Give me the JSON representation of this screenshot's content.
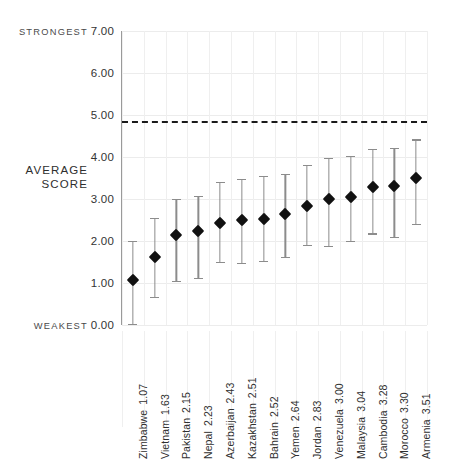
{
  "chart_data": {
    "type": "scatter",
    "title": "",
    "subtitle": "",
    "xlabel": "",
    "ylabel": "AVERAGE SCORE",
    "ylim": [
      0.0,
      7.0
    ],
    "yticks": [
      "0.00",
      "1.00",
      "2.00",
      "3.00",
      "4.00",
      "5.00",
      "6.00",
      "7.00"
    ],
    "ytick_values": [
      0,
      1,
      2,
      3,
      4,
      5,
      6,
      7
    ],
    "grid": true,
    "legend": null,
    "axis_annotations": {
      "top": "STRONGEST",
      "middle": "AVERAGE SCORE",
      "bottom": "WEAKEST"
    },
    "threshold_line": {
      "value": 4.86,
      "style": "dashed",
      "color": "#1a1a1a",
      "label": ""
    },
    "categories": [
      "Zimbabwe",
      "Vietnam",
      "Pakistan",
      "Nepal",
      "Azerbaijan",
      "Kazakhstan",
      "Bahrain",
      "Yemen",
      "Jordan",
      "Venezuela",
      "Malaysia",
      "Cambodia",
      "Morocco",
      "Armenia"
    ],
    "values": [
      1.07,
      1.63,
      2.15,
      2.23,
      2.43,
      2.51,
      2.52,
      2.64,
      2.83,
      3.0,
      3.04,
      3.28,
      3.3,
      3.51
    ],
    "error_low": [
      0.03,
      0.67,
      1.05,
      1.13,
      1.5,
      1.48,
      1.52,
      1.62,
      1.9,
      1.88,
      2.0,
      2.18,
      2.1,
      2.4
    ],
    "error_high": [
      2.0,
      2.55,
      3.0,
      3.07,
      3.4,
      3.48,
      3.55,
      3.6,
      3.82,
      3.98,
      4.02,
      4.2,
      4.22,
      4.42
    ],
    "points": [
      {
        "label": "Zimbabwe",
        "value": 1.07,
        "low": 0.03,
        "high": 2.0
      },
      {
        "label": "Vietnam",
        "value": 1.63,
        "low": 0.67,
        "high": 2.55
      },
      {
        "label": "Pakistan",
        "value": 2.15,
        "low": 1.05,
        "high": 3.0
      },
      {
        "label": "Nepal",
        "value": 2.23,
        "low": 1.13,
        "high": 3.07
      },
      {
        "label": "Azerbaijan",
        "value": 2.43,
        "low": 1.5,
        "high": 3.4
      },
      {
        "label": "Kazakhstan",
        "value": 2.51,
        "low": 1.48,
        "high": 3.48
      },
      {
        "label": "Bahrain",
        "value": 2.52,
        "low": 1.52,
        "high": 3.55
      },
      {
        "label": "Yemen",
        "value": 2.64,
        "low": 1.62,
        "high": 3.6
      },
      {
        "label": "Jordan",
        "value": 2.83,
        "low": 1.9,
        "high": 3.82
      },
      {
        "label": "Venezuela",
        "value": 3.0,
        "low": 1.88,
        "high": 3.98
      },
      {
        "label": "Malaysia",
        "value": 3.04,
        "low": 2.0,
        "high": 4.02
      },
      {
        "label": "Cambodia",
        "value": 3.28,
        "low": 2.18,
        "high": 4.2
      },
      {
        "label": "Morocco",
        "value": 3.3,
        "low": 2.1,
        "high": 4.22
      },
      {
        "label": "Armenia",
        "value": 3.51,
        "low": 2.4,
        "high": 4.42
      }
    ],
    "colors": {
      "marker": "#111111",
      "errorbar": "#8c8c8c",
      "grid": "#ececec",
      "axis": "#9a9a9a",
      "threshold": "#1a1a1a",
      "text": "#2f2f2f"
    }
  }
}
